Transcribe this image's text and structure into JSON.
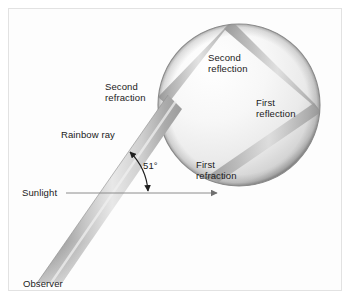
{
  "figure": {
    "background_color": "#fdfdfd",
    "frame_color": "#e2e2e2",
    "width": 352,
    "height": 301
  },
  "labels": {
    "second_reflection": "Second\nreflection",
    "second_reflection_line1": "Second",
    "second_reflection_line2": "reflection",
    "first_reflection_line1": "First",
    "first_reflection_line2": "reflection",
    "first_refraction_line1": "First",
    "first_refraction_line2": "refraction",
    "second_refraction_line1": "Second",
    "second_refraction_line2": "refraction",
    "rainbow_ray": "Rainbow ray",
    "angle": "51°",
    "sunlight": "Sunlight",
    "observer": "Observer"
  },
  "colors": {
    "sphere_light": "#fbfbfb",
    "sphere_mid": "#e4e4e4",
    "sphere_edge": "#8f8f8f",
    "sphere_outline": "#7a7a7a",
    "beam_dark": "#8a8a8a",
    "beam_mid": "#b8b8b8",
    "beam_light": "#ededed",
    "leader_line": "#8c8c8c",
    "text": "#1a1a1a"
  },
  "geometry": {
    "sphere_center_x": 239,
    "sphere_center_y": 105,
    "sphere_radius": 81,
    "sunlight_arrow_y": 193,
    "sunlight_arrow_x_start": 66,
    "sunlight_arrow_x_end": 217,
    "angle_degrees": 51
  }
}
